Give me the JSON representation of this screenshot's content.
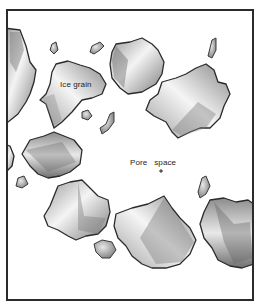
{
  "figure": {
    "labels": {
      "ice_grain": "Ice grain",
      "pore_space": "Pore   space"
    },
    "colors": {
      "frame": "#2b2b2b",
      "grain_outline": "#2a2a2a",
      "grain_light": "#f2f2f2",
      "grain_shade": "#8a8a8a",
      "background": "#ffffff"
    },
    "elements": {
      "large_grain_count": 9,
      "small_particle_count": 9
    }
  }
}
